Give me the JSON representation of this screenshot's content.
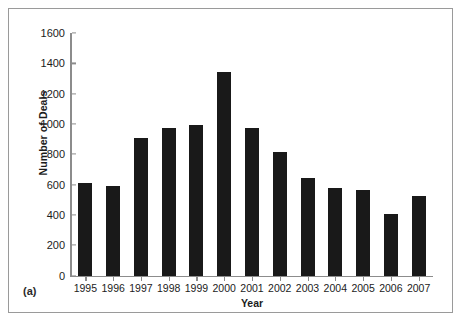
{
  "figure": {
    "caption": "(a)",
    "border_color": "#9a9a9a",
    "background": "#ffffff"
  },
  "chart_data": {
    "type": "bar",
    "title": "",
    "xlabel": "Year",
    "ylabel": "Number of Deals",
    "categories": [
      "1995",
      "1996",
      "1997",
      "1998",
      "1999",
      "2000",
      "2001",
      "2002",
      "2003",
      "2004",
      "2005",
      "2006",
      "2007"
    ],
    "values": [
      610,
      590,
      905,
      975,
      990,
      1340,
      970,
      815,
      645,
      575,
      565,
      405,
      525
    ],
    "ylim": [
      0,
      1600
    ],
    "yticks": [
      0,
      200,
      400,
      600,
      800,
      1000,
      1200,
      1400,
      1600
    ],
    "ytick_labels": [
      "0",
      "200",
      "400",
      "600",
      "800",
      "1000",
      "1200",
      "1400",
      "1600"
    ],
    "grid": false,
    "legend": null,
    "bar_color": "#191919",
    "axis_color": "#8c8c8c"
  }
}
